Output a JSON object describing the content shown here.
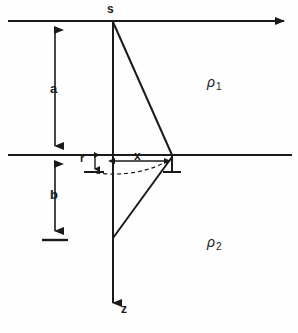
{
  "figure": {
    "background_color": "#fefefe",
    "line_color": "#1a1a1a",
    "width": 298,
    "height": 333
  },
  "labels": {
    "source": "s",
    "depth_above": "a",
    "depth_below": "b",
    "radius": "r",
    "offset": "x",
    "depth_axis": "z",
    "resistivity_upper_symbol": "ρ",
    "resistivity_upper_sub": "1",
    "resistivity_lower_symbol": "ρ",
    "resistivity_lower_sub": "2"
  },
  "geometry": {
    "surface_line_y": 21,
    "interface_line_y": 155,
    "axis_x": 113,
    "receiver_x": 172,
    "lower_vertex_y": 238,
    "z_arrow_end_y": 312,
    "dimension_arrow_x": 55,
    "b_baseline_y": 240,
    "line_left": 8,
    "line_right": 292
  }
}
